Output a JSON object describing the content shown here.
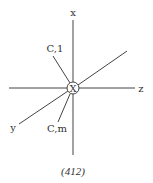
{
  "diagram": {
    "center_symbol": "X",
    "axes": {
      "x": "x",
      "y": "y",
      "z": "z"
    },
    "rays": {
      "upper": "C,1",
      "lower": "C,m"
    },
    "caption": "(412)"
  },
  "colors": {
    "line": "#444444",
    "text": "#333333",
    "background": "#ffffff"
  }
}
